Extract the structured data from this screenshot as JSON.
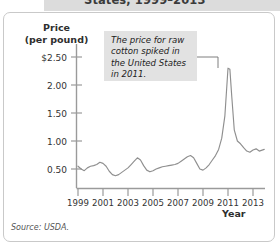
{
  "figure": {
    "title_visible_fragment": "States, 1999–2013",
    "source_note": "Source: USDA.",
    "annotation": "The price for raw cotton spiked in the United States in 2011.",
    "colors": {
      "line": "#8f8f8f",
      "axis": "#9a9a9a",
      "callout_bg": "#e2e2e2",
      "frame_border": "#c9c9c9",
      "title_strip_bg": "#dcdcdc",
      "text": "#2e2e2e"
    }
  },
  "chart_data": {
    "type": "line",
    "title": "States, 1999–2013",
    "xlabel": "Year",
    "ylabel": "Price (per pound)",
    "ylabel_line1": "Price",
    "ylabel_line2": "(per pound)",
    "grid": false,
    "legend": "none",
    "xlim": [
      1999,
      2014
    ],
    "ylim": [
      0,
      2.75
    ],
    "ytick_labels": [
      "$2.50",
      "2.00",
      "1.50",
      "1.00",
      "0.50"
    ],
    "ytick_values": [
      2.5,
      2.0,
      1.5,
      1.0,
      0.5
    ],
    "xtick_labels": [
      "1999",
      "2001",
      "2003",
      "2005",
      "2007",
      "2009",
      "2011",
      "2013"
    ],
    "xtick_values": [
      1999,
      2001,
      2003,
      2005,
      2007,
      2009,
      2011,
      2013
    ],
    "units": "US dollars per pound",
    "annotations": [
      {
        "text": "The price for raw cotton spiked in the United States in 2011.",
        "points_to_x": 2011,
        "points_to_y": 2.3
      }
    ],
    "series": [
      {
        "name": "Raw cotton price",
        "x": [
          1999.0,
          1999.25,
          1999.5,
          1999.75,
          2000.0,
          2000.25,
          2000.5,
          2000.75,
          2001.0,
          2001.25,
          2001.5,
          2001.75,
          2002.0,
          2002.25,
          2002.5,
          2002.75,
          2003.0,
          2003.25,
          2003.5,
          2003.75,
          2004.0,
          2004.25,
          2004.5,
          2004.75,
          2005.0,
          2005.25,
          2005.5,
          2005.75,
          2006.0,
          2006.25,
          2006.5,
          2006.75,
          2007.0,
          2007.25,
          2007.5,
          2007.75,
          2008.0,
          2008.25,
          2008.5,
          2008.75,
          2009.0,
          2009.25,
          2009.5,
          2009.75,
          2010.0,
          2010.25,
          2010.5,
          2010.75,
          2011.0,
          2011.15,
          2011.3,
          2011.5,
          2011.75,
          2012.0,
          2012.25,
          2012.5,
          2012.75,
          2013.0,
          2013.25,
          2013.5,
          2013.9
        ],
        "y": [
          0.55,
          0.5,
          0.47,
          0.52,
          0.55,
          0.56,
          0.58,
          0.62,
          0.6,
          0.55,
          0.46,
          0.4,
          0.38,
          0.4,
          0.44,
          0.48,
          0.52,
          0.58,
          0.64,
          0.7,
          0.66,
          0.56,
          0.48,
          0.45,
          0.47,
          0.5,
          0.52,
          0.54,
          0.55,
          0.56,
          0.57,
          0.58,
          0.6,
          0.64,
          0.68,
          0.72,
          0.74,
          0.7,
          0.6,
          0.5,
          0.48,
          0.52,
          0.58,
          0.66,
          0.74,
          0.85,
          1.05,
          1.45,
          2.3,
          2.28,
          1.8,
          1.2,
          1.0,
          0.95,
          0.88,
          0.82,
          0.8,
          0.84,
          0.86,
          0.82,
          0.85
        ]
      }
    ]
  }
}
